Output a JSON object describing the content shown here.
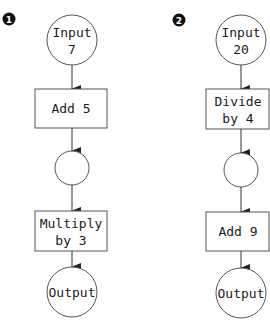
{
  "flowcharts": [
    {
      "badge": "1",
      "input": {
        "line1": "Input",
        "line2": "7"
      },
      "step1": {
        "line1": "Add 5",
        "line2": ""
      },
      "intermediate": "",
      "step2": {
        "line1": "Multiply",
        "line2": "by 3"
      },
      "output": "Output"
    },
    {
      "badge": "2",
      "input": {
        "line1": "Input",
        "line2": "20"
      },
      "step1": {
        "line1": "Divide",
        "line2": "by 4"
      },
      "intermediate": "",
      "step2": {
        "line1": "Add 9",
        "line2": ""
      },
      "output": "Output"
    }
  ],
  "colors": {
    "stroke": "#555555",
    "text": "#1a1a1a",
    "badge": "#111111"
  }
}
